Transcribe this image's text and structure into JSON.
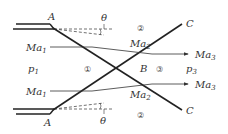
{
  "diagram": {
    "points": {
      "A_top": "A",
      "A_bottom": "A",
      "B": "B",
      "C_top": "C",
      "C_bottom": "C"
    },
    "angles": {
      "top": "θ",
      "bottom": "θ"
    },
    "regions": {
      "r1": "①",
      "r2_top": "②",
      "r2_bottom": "②",
      "r3": "③"
    },
    "pressures": {
      "p1_base": "p",
      "p1_sub": "1",
      "p3_base": "p",
      "p3_sub": "3"
    },
    "mach": {
      "base": "Ma",
      "ma1_top_sub": "1",
      "ma1_bottom_sub": "1",
      "ma2_top_sub": "2",
      "ma2_bottom_sub": "2",
      "ma3_top_sub": "3",
      "ma3_bottom_sub": "3"
    }
  }
}
